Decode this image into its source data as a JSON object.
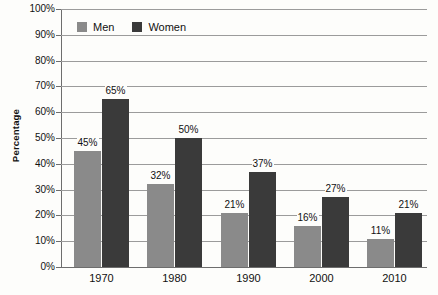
{
  "chart_data": {
    "type": "bar",
    "title": "",
    "xlabel": "",
    "ylabel": "Percentage",
    "categories": [
      "1970",
      "1980",
      "1990",
      "2000",
      "2010"
    ],
    "series": [
      {
        "name": "Men",
        "color": "#8a8a8a",
        "values": [
          45,
          32,
          21,
          16,
          11
        ],
        "labels": [
          "45%",
          "32%",
          "21%",
          "16%",
          "11%"
        ]
      },
      {
        "name": "Women",
        "color": "#3a3a3a",
        "values": [
          65,
          50,
          37,
          27,
          21
        ],
        "labels": [
          "65%",
          "50%",
          "37%",
          "27%",
          "21%"
        ]
      }
    ],
    "ylim": [
      0,
      100
    ],
    "y_tick_values": [
      0,
      10,
      20,
      30,
      40,
      50,
      60,
      70,
      80,
      90,
      100
    ],
    "y_tick_labels": [
      "0%",
      "10%",
      "20%",
      "30%",
      "40%",
      "50%",
      "60%",
      "70%",
      "80%",
      "90%",
      "100%"
    ],
    "grid": true,
    "legend_position": "top-left-inside",
    "gridline_color": "#9b9b9b",
    "axis_color": "#6d6d6d",
    "background_color": "#fdfdfb"
  }
}
